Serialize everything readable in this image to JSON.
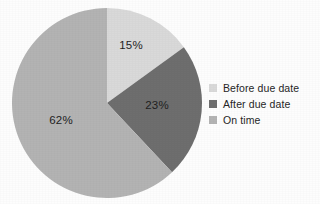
{
  "chart_data": {
    "type": "pie",
    "title": "",
    "subtitle": "",
    "xlabel": "",
    "ylabel": "",
    "grid": false,
    "legend_position": "right",
    "start_angle_deg": 0,
    "direction": "clockwise",
    "center": {
      "cx": 107,
      "cy": 103,
      "r": 95
    },
    "categories": [
      "Before due date",
      "After due date",
      "On time"
    ],
    "values": [
      15,
      23,
      62
    ],
    "data_labels": [
      "15%",
      "23%",
      "62%"
    ],
    "colors": [
      "#d9d9d9",
      "#6e6e6e",
      "#b3b3b3"
    ],
    "slices": [
      {
        "label": "Before due date",
        "value": 15,
        "data_label": "15%",
        "color": "#d9d9d9",
        "start_deg": 0,
        "end_deg": 54,
        "label_x": 131,
        "label_y": 46
      },
      {
        "label": "After due date",
        "value": 23,
        "data_label": "23%",
        "color": "#6e6e6e",
        "start_deg": 54,
        "end_deg": 136.8,
        "label_x": 157,
        "label_y": 106
      },
      {
        "label": "On time",
        "value": 62,
        "data_label": "62%",
        "color": "#b3b3b3",
        "start_deg": 136.8,
        "end_deg": 360,
        "label_x": 61,
        "label_y": 121
      }
    ]
  },
  "legend": {
    "items": [
      {
        "label": "Before due date",
        "color": "#d9d9d9",
        "swatch_name": "legend-swatch-before-due-date"
      },
      {
        "label": "After due date",
        "color": "#6e6e6e",
        "swatch_name": "legend-swatch-after-due-date"
      },
      {
        "label": "On time",
        "color": "#b3b3b3",
        "swatch_name": "legend-swatch-on-time"
      }
    ]
  },
  "canvas": {
    "background": "#fdfdfd",
    "label_text_color": "#1f1f1f",
    "legend_text_color": "#262626"
  }
}
